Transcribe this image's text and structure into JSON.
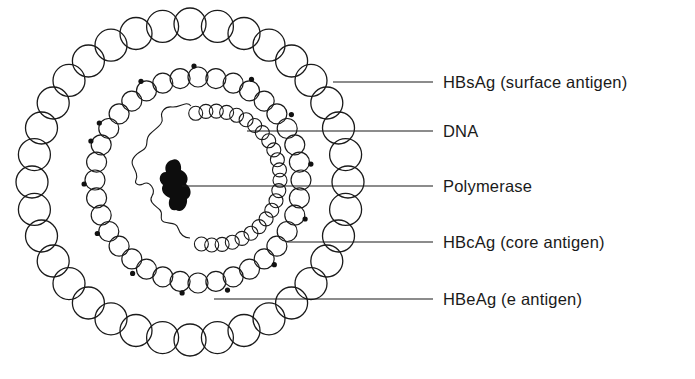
{
  "figure": {
    "type": "schematic",
    "stroke_color": "#1a1a1a",
    "background": "#ffffff"
  },
  "labels": [
    {
      "id": "hbsag",
      "text": "HBsAg (surface antigen)",
      "line_y": 82,
      "line_x_start": 333
    },
    {
      "id": "dna",
      "text": "DNA",
      "line_y": 131,
      "line_x_start": 247
    },
    {
      "id": "polymerase",
      "text": "Polymerase",
      "line_y": 186,
      "line_x_start": 182
    },
    {
      "id": "hbcag",
      "text": "HBcAg (core antigen)",
      "line_y": 242,
      "line_x_start": 287
    },
    {
      "id": "hbeag",
      "text": "HBeAg (e antigen)",
      "line_y": 299,
      "line_x_start": 214
    }
  ],
  "rings": {
    "outer": {
      "name": "surface-antigen-ring",
      "cx": 190,
      "cy": 182,
      "r": 158,
      "bead_r": 16,
      "count": 36
    },
    "middle": {
      "name": "core-antigen-ring",
      "cx": 198,
      "cy": 180,
      "r": 103,
      "bead_r": 10,
      "count": 36
    },
    "inner": {
      "name": "dna-bead-ring",
      "cx": 213,
      "cy": 178,
      "r": 67,
      "bead_r": 7,
      "arc_start_deg": -105,
      "arc_end_deg": 100,
      "count": 24
    }
  }
}
